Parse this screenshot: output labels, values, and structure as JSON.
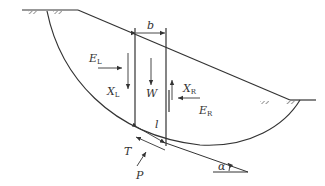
{
  "diagram": {
    "labels": {
      "b": "b",
      "EL": "E",
      "EL_sub": "L",
      "XL": "X",
      "XL_sub": "L",
      "W": "W",
      "XR": "X",
      "XR_sub": "R",
      "ER": "E",
      "ER_sub": "R",
      "l": "l",
      "T": "T",
      "P": "P",
      "alpha": "α"
    },
    "colors": {
      "line": "#333333",
      "background": "#ffffff"
    }
  }
}
